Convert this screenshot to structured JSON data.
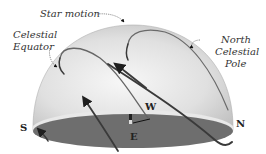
{
  "diagram": {
    "labels": {
      "star_motion": "Star motion",
      "celestial_equator_line1": "Celestial",
      "celestial_equator_line2": "Equator",
      "north_pole_line1": "North",
      "north_pole_line2": "Celestial",
      "north_pole_line3": "Pole"
    },
    "directions": {
      "south": "S",
      "north": "N",
      "east": "E",
      "west": "W"
    },
    "colors": {
      "dome_light": "#f2f2f2",
      "dome_shade": "#c8c8c8",
      "ground": "#6e6e6e",
      "ground_rim": "#e8e8e8",
      "arc_stroke": "#3a3a3a",
      "text": "#333333"
    }
  }
}
